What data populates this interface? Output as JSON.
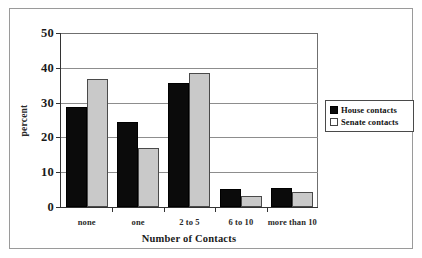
{
  "chart_data": {
    "type": "bar",
    "title": "",
    "xlabel": "Number of Contacts",
    "ylabel": "percent",
    "categories": [
      "none",
      "one",
      "2 to 5",
      "6 to 10",
      "more than 10"
    ],
    "series": [
      {
        "name": "House contacts",
        "color": "#0b0b0b",
        "values": [
          28.7,
          24.5,
          35.6,
          5.2,
          5.6
        ]
      },
      {
        "name": "Senate contacts",
        "color": "#c9c9c9",
        "values": [
          36.7,
          17.0,
          38.5,
          3.3,
          4.2
        ]
      }
    ],
    "ylim": [
      0,
      50
    ],
    "yticks": [
      0,
      10,
      20,
      30,
      40,
      50
    ],
    "ytick_labels": [
      "0",
      "10",
      "20",
      "30",
      "40",
      "50"
    ],
    "grid": "horizontal",
    "legend_position": "right-outside",
    "legend_entries": [
      "House contacts",
      "Senate contacts"
    ]
  }
}
